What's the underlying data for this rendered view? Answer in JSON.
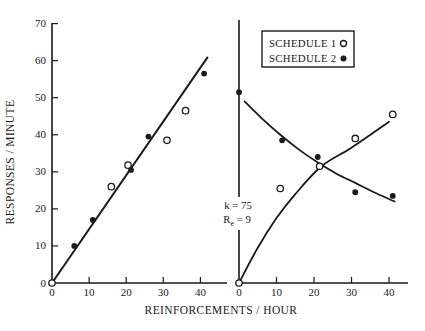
{
  "figure": {
    "xlabel": "REINFORCEMENTS / HOUR",
    "ylabel": "RESPONSES / MINUTE",
    "ink_color": "#1a1a1a",
    "background_color": "#ffffff"
  },
  "legend": {
    "items": [
      {
        "label": "SCHEDULE 1",
        "marker": "open"
      },
      {
        "label": "SCHEDULE 2",
        "marker": "filled"
      }
    ]
  },
  "annotation": {
    "line1": "k = 75",
    "line2": {
      "base": "R",
      "sub": "e",
      "rest": " = 9"
    }
  },
  "chart_data": [
    {
      "type": "scatter",
      "panel": "left",
      "xlim": [
        0,
        47
      ],
      "ylim": [
        0,
        70
      ],
      "x_ticks": [
        0,
        10,
        20,
        30,
        40
      ],
      "y_ticks": [
        0,
        10,
        20,
        30,
        40,
        50,
        60,
        70
      ],
      "grid": false,
      "series": [
        {
          "name": "SCHEDULE 1",
          "marker": "open",
          "points": [
            [
              0,
              0
            ],
            [
              16,
              26
            ],
            [
              20.5,
              31.8
            ],
            [
              31,
              38.5
            ],
            [
              36,
              46.5
            ]
          ]
        },
        {
          "name": "SCHEDULE 2",
          "marker": "filled",
          "points": [
            [
              6,
              10
            ],
            [
              11,
              17
            ],
            [
              21.3,
              30.5
            ],
            [
              26,
              39.5
            ],
            [
              41,
              56.5
            ]
          ]
        }
      ],
      "fit_line": {
        "from": [
          0,
          0
        ],
        "to": [
          42,
          61
        ]
      }
    },
    {
      "type": "scatter",
      "panel": "right",
      "xlim": [
        0,
        45
      ],
      "ylim": [
        0,
        70
      ],
      "x_ticks": [
        0,
        10,
        20,
        30,
        40
      ],
      "y_ticks": [],
      "grid": false,
      "series": [
        {
          "name": "SCHEDULE 1",
          "marker": "open",
          "points": [
            [
              0,
              0
            ],
            [
              11,
              25.5
            ],
            [
              21.5,
              31.5
            ],
            [
              31,
              39
            ],
            [
              41,
              45.5
            ]
          ]
        },
        {
          "name": "SCHEDULE 2",
          "marker": "filled",
          "points": [
            [
              0,
              51.5
            ],
            [
              11.5,
              38.5
            ],
            [
              21,
              34
            ],
            [
              31,
              24.5
            ],
            [
              41,
              23.5
            ]
          ]
        }
      ],
      "curves": [
        {
          "series": "SCHEDULE 1",
          "points": [
            [
              0,
              0
            ],
            [
              5,
              9.5
            ],
            [
              10,
              17.5
            ],
            [
              15,
              24
            ],
            [
              22,
              31.5
            ],
            [
              30,
              36.5
            ],
            [
              40,
              43.5
            ]
          ]
        },
        {
          "series": "SCHEDULE 2",
          "points": [
            [
              1.5,
              49
            ],
            [
              6,
              44.5
            ],
            [
              11,
              40
            ],
            [
              16,
              36
            ],
            [
              21,
              32.5
            ],
            [
              26,
              29.5
            ],
            [
              31,
              27
            ],
            [
              36,
              24.5
            ],
            [
              41.5,
              22
            ]
          ]
        }
      ]
    }
  ]
}
